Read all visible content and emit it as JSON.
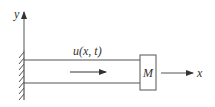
{
  "diagram": {
    "type": "cantilever-rod-with-end-mass",
    "labels": {
      "y_axis": "y",
      "x_axis": "x",
      "displacement": "u(x, t)",
      "mass": "M"
    },
    "colors": {
      "line": "#555555",
      "text": "#333333",
      "background": "#ffffff"
    }
  }
}
